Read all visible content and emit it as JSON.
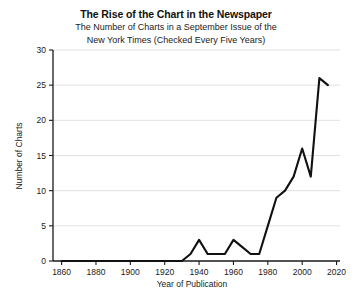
{
  "chart_data": {
    "type": "line",
    "title": "The Rise of the Chart in the Newspaper",
    "subtitle_line1": "The Number of Charts in a September Issue of the",
    "subtitle_line2": "New York Times (Checked Every Five Years)",
    "xlabel": "Year of Publication",
    "ylabel": "Number of Charts",
    "xlim": [
      1855,
      2022
    ],
    "ylim": [
      0,
      30
    ],
    "xticks": [
      1860,
      1880,
      1900,
      1920,
      1940,
      1960,
      1980,
      2000,
      2020
    ],
    "yticks": [
      0,
      5,
      10,
      15,
      20,
      25,
      30
    ],
    "grid": "horizontal",
    "legend": "none",
    "x": [
      1860,
      1865,
      1870,
      1875,
      1880,
      1885,
      1890,
      1895,
      1900,
      1905,
      1910,
      1915,
      1920,
      1925,
      1930,
      1935,
      1940,
      1945,
      1950,
      1955,
      1960,
      1965,
      1970,
      1975,
      1980,
      1985,
      1990,
      1995,
      2000,
      2005,
      2010,
      2015
    ],
    "values": [
      0,
      0,
      0,
      0,
      0,
      0,
      0,
      0,
      0,
      0,
      0,
      0,
      0,
      0,
      0,
      1,
      3,
      1,
      1,
      1,
      3,
      2,
      1,
      1,
      5,
      9,
      10,
      12,
      16,
      12,
      26,
      25
    ],
    "series_name": "Number of Charts"
  },
  "axis": {
    "y_tick_labels": [
      "0",
      "5",
      "10",
      "15",
      "20",
      "25",
      "30"
    ],
    "x_tick_labels": [
      "1860",
      "1880",
      "1900",
      "1920",
      "1940",
      "1960",
      "1980",
      "2000",
      "2020"
    ]
  },
  "colors": {
    "line": "#111111",
    "grid": "#d9d9d9",
    "axis": "#1a1a1a",
    "background": "#ffffff"
  }
}
